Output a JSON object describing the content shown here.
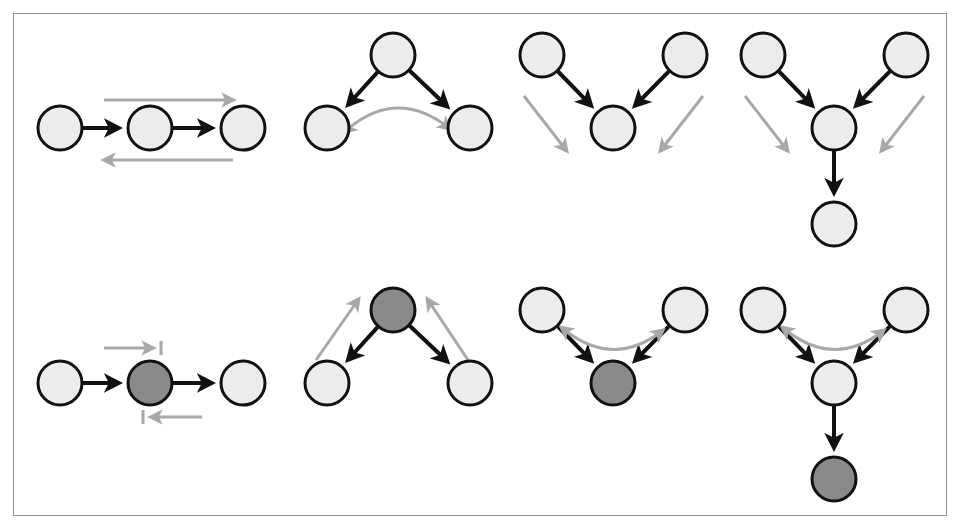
{
  "figure": {
    "width": 962,
    "height": 531,
    "background_color": "#ffffff",
    "frame": {
      "color": "#909090",
      "x": 13,
      "y": 13,
      "width": 934,
      "height": 503
    },
    "legend_note": "Top row: unconditioned structures. Bottom row: same structures with one node conditioned (shaded dark).",
    "styles": {
      "node_radius": 22,
      "node_light_fill": "#ececec",
      "node_dark_fill": "#8a8a8a",
      "node_stroke": "#111111",
      "node_stroke_width": 3,
      "causal_edge_color": "#111111",
      "causal_edge_width": 4,
      "flow_arrow_color": "#a8a8a8",
      "flow_arrow_width": 3,
      "blocked_bar_color": "#a8a8a8"
    }
  },
  "chart_data": {
    "type": "diagram",
    "diagram_kind": "directed-acyclic-graph-panels",
    "rows": 2,
    "columns": 4,
    "node_states": [
      "unconditioned",
      "conditioned"
    ],
    "edge_kinds": [
      "causal-edge",
      "information-flow",
      "information-flow-blocked"
    ],
    "panels": [
      {
        "id": "panel-1",
        "row": 1,
        "column": 1,
        "name": "chain-open",
        "structure": "chain",
        "conditioned": false,
        "flow_status": "open",
        "nodes": [
          {
            "id": "a",
            "cx": 60,
            "cy": 128,
            "state": "unconditioned"
          },
          {
            "id": "b",
            "cx": 150,
            "cy": 128,
            "state": "unconditioned"
          },
          {
            "id": "c",
            "cx": 243,
            "cy": 128,
            "state": "unconditioned"
          }
        ],
        "causal_edges": [
          {
            "from": "a",
            "to": "b"
          },
          {
            "from": "b",
            "to": "c"
          }
        ],
        "flow_arrows": [
          {
            "from": [
              104,
              100
            ],
            "to": [
              232,
              100
            ],
            "blocked": false,
            "direction": "right"
          },
          {
            "from": [
              233,
              160
            ],
            "to": [
              105,
              160
            ],
            "blocked": false,
            "direction": "left"
          }
        ]
      },
      {
        "id": "panel-2",
        "row": 1,
        "column": 2,
        "name": "fork-open",
        "structure": "fork",
        "conditioned": false,
        "flow_status": "open",
        "nodes": [
          {
            "id": "a",
            "cx": 393,
            "cy": 55,
            "state": "unconditioned"
          },
          {
            "id": "b",
            "cx": 327,
            "cy": 128,
            "state": "unconditioned"
          },
          {
            "id": "c",
            "cx": 470,
            "cy": 128,
            "state": "unconditioned"
          }
        ],
        "causal_edges": [
          {
            "from": "a",
            "to": "b"
          },
          {
            "from": "a",
            "to": "c"
          }
        ],
        "flow_arrows": [
          {
            "curve": [
              [
                349,
                128
              ],
              [
                398,
                88
              ],
              [
                449,
                128
              ]
            ],
            "blocked": false,
            "direction": "both"
          }
        ]
      },
      {
        "id": "panel-3",
        "row": 1,
        "column": 3,
        "name": "collider-closed",
        "structure": "collider",
        "conditioned": false,
        "flow_status": "blocked-at-collider",
        "nodes": [
          {
            "id": "a",
            "cx": 542,
            "cy": 55,
            "state": "unconditioned"
          },
          {
            "id": "b",
            "cx": 685,
            "cy": 55,
            "state": "unconditioned"
          },
          {
            "id": "c",
            "cx": 613,
            "cy": 128,
            "state": "unconditioned"
          }
        ],
        "causal_edges": [
          {
            "from": "a",
            "to": "c"
          },
          {
            "from": "b",
            "to": "c"
          }
        ],
        "flow_arrows": [
          {
            "from": [
              524,
              96
            ],
            "to": [
              566,
              150
            ],
            "blocked": false,
            "direction": "down-right"
          },
          {
            "from": [
              703,
              96
            ],
            "to": [
              661,
              150
            ],
            "blocked": false,
            "direction": "down-left"
          }
        ]
      },
      {
        "id": "panel-4",
        "row": 1,
        "column": 4,
        "name": "collider-with-descendant-closed",
        "structure": "collider-with-descendant",
        "conditioned": false,
        "flow_status": "blocked-at-collider",
        "nodes": [
          {
            "id": "a",
            "cx": 763,
            "cy": 55,
            "state": "unconditioned"
          },
          {
            "id": "b",
            "cx": 906,
            "cy": 55,
            "state": "unconditioned"
          },
          {
            "id": "c",
            "cx": 834,
            "cy": 128,
            "state": "unconditioned"
          },
          {
            "id": "d",
            "cx": 834,
            "cy": 224,
            "state": "unconditioned"
          }
        ],
        "causal_edges": [
          {
            "from": "a",
            "to": "c"
          },
          {
            "from": "b",
            "to": "c"
          },
          {
            "from": "c",
            "to": "d"
          }
        ],
        "flow_arrows": [
          {
            "from": [
              745,
              96
            ],
            "to": [
              787,
              150
            ],
            "blocked": false,
            "direction": "down-right"
          },
          {
            "from": [
              924,
              96
            ],
            "to": [
              882,
              150
            ],
            "blocked": false,
            "direction": "down-left"
          }
        ]
      },
      {
        "id": "panel-5",
        "row": 2,
        "column": 1,
        "name": "chain-blocked",
        "structure": "chain",
        "conditioned": true,
        "conditioned_node": "b",
        "flow_status": "blocked",
        "nodes": [
          {
            "id": "a",
            "cx": 60,
            "cy": 383,
            "state": "unconditioned"
          },
          {
            "id": "b",
            "cx": 150,
            "cy": 383,
            "state": "conditioned"
          },
          {
            "id": "c",
            "cx": 243,
            "cy": 383,
            "state": "unconditioned"
          }
        ],
        "causal_edges": [
          {
            "from": "a",
            "to": "b"
          },
          {
            "from": "b",
            "to": "c"
          }
        ],
        "flow_arrows": [
          {
            "from": [
              104,
              348
            ],
            "to": [
              152,
              348
            ],
            "blocked": true,
            "direction": "right"
          },
          {
            "from": [
              202,
              417
            ],
            "to": [
              152,
              417
            ],
            "blocked": true,
            "direction": "left"
          }
        ]
      },
      {
        "id": "panel-6",
        "row": 2,
        "column": 2,
        "name": "fork-blocked",
        "structure": "fork",
        "conditioned": true,
        "conditioned_node": "a",
        "flow_status": "blocked",
        "nodes": [
          {
            "id": "a",
            "cx": 393,
            "cy": 310,
            "state": "conditioned"
          },
          {
            "id": "b",
            "cx": 327,
            "cy": 383,
            "state": "unconditioned"
          },
          {
            "id": "c",
            "cx": 470,
            "cy": 383,
            "state": "unconditioned"
          }
        ],
        "causal_edges": [
          {
            "from": "a",
            "to": "b"
          },
          {
            "from": "a",
            "to": "c"
          }
        ],
        "flow_arrows": [
          {
            "from": [
              316,
              360
            ],
            "to": [
              358,
              300
            ],
            "blocked": false,
            "direction": "up-right"
          },
          {
            "from": [
              468,
              360
            ],
            "to": [
              428,
              300
            ],
            "blocked": false,
            "direction": "up-left"
          }
        ]
      },
      {
        "id": "panel-7",
        "row": 2,
        "column": 3,
        "name": "collider-opened",
        "structure": "collider",
        "conditioned": true,
        "conditioned_node": "c",
        "flow_status": "open",
        "nodes": [
          {
            "id": "a",
            "cx": 542,
            "cy": 310,
            "state": "unconditioned"
          },
          {
            "id": "b",
            "cx": 685,
            "cy": 310,
            "state": "unconditioned"
          },
          {
            "id": "c",
            "cx": 613,
            "cy": 383,
            "state": "conditioned"
          }
        ],
        "causal_edges": [
          {
            "from": "a",
            "to": "c"
          },
          {
            "from": "b",
            "to": "c"
          }
        ],
        "flow_arrows": [
          {
            "curve": [
              [
                566,
                331
              ],
              [
                614,
                368
              ],
              [
                662,
                331
              ]
            ],
            "blocked": false,
            "direction": "both"
          }
        ]
      },
      {
        "id": "panel-8",
        "row": 2,
        "column": 4,
        "name": "collider-with-conditioned-descendant-opened",
        "structure": "collider-with-descendant",
        "conditioned": true,
        "conditioned_node": "d",
        "flow_status": "open",
        "nodes": [
          {
            "id": "a",
            "cx": 763,
            "cy": 310,
            "state": "unconditioned"
          },
          {
            "id": "b",
            "cx": 906,
            "cy": 310,
            "state": "unconditioned"
          },
          {
            "id": "c",
            "cx": 834,
            "cy": 383,
            "state": "unconditioned"
          },
          {
            "id": "d",
            "cx": 834,
            "cy": 479,
            "state": "conditioned"
          }
        ],
        "causal_edges": [
          {
            "from": "a",
            "to": "c"
          },
          {
            "from": "b",
            "to": "c"
          },
          {
            "from": "c",
            "to": "d"
          }
        ],
        "flow_arrows": [
          {
            "curve": [
              [
                787,
                331
              ],
              [
                835,
                368
              ],
              [
                883,
                331
              ]
            ],
            "blocked": false,
            "direction": "both"
          }
        ]
      }
    ]
  }
}
